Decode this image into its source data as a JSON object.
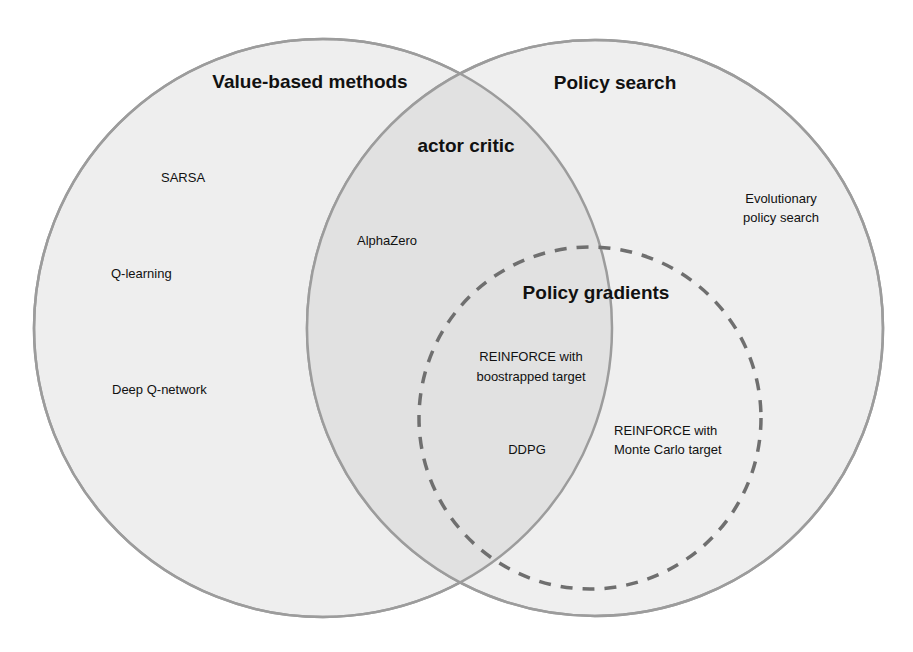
{
  "diagram": {
    "type": "venn",
    "colors": {
      "background": "#ffffff",
      "circle_fill": "#eeeeee",
      "circle_stroke": "#9c9c9c",
      "overlap_fill": "#e2e2e2",
      "dashed_stroke": "#6f6f6f",
      "text": "#111111"
    },
    "sets": {
      "value_based": {
        "title": "Value-based methods",
        "items": [
          "SARSA",
          "Q-learning",
          "Deep Q-network"
        ]
      },
      "policy_search": {
        "title": "Policy search",
        "items": [
          "Evolutionary",
          "policy search"
        ]
      },
      "actor_critic": {
        "title": "actor critic",
        "items": [
          "AlphaZero"
        ]
      },
      "policy_gradients": {
        "title": "Policy gradients",
        "items": {
          "reinforce_bootstrap": [
            "REINFORCE with",
            "boostrapped target"
          ],
          "ddpg": "DDPG",
          "reinforce_mc": [
            "REINFORCE with",
            "Monte Carlo target"
          ]
        }
      }
    }
  }
}
